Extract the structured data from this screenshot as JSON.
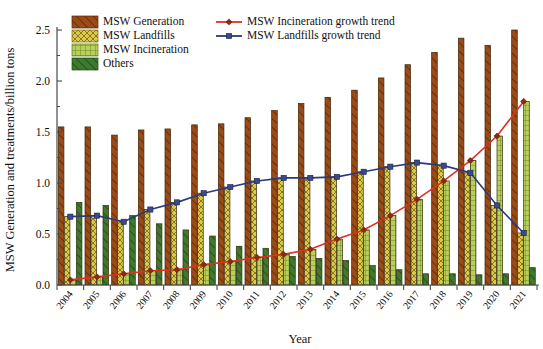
{
  "chart_data": {
    "type": "bar",
    "title": "",
    "xlabel": "Year",
    "ylabel": "MSW Generation and treatments/billion tons",
    "ylim": [
      0.0,
      2.5
    ],
    "ytick_labels": [
      "0.0",
      "0.5",
      "1.0",
      "1.5",
      "2.0",
      "2.5"
    ],
    "ytick_values": [
      0.0,
      0.5,
      1.0,
      1.5,
      2.0,
      2.5
    ],
    "grid": false,
    "legend_position": "top-left",
    "categories": [
      "2004",
      "2005",
      "2006",
      "2007",
      "2008",
      "2009",
      "2010",
      "2011",
      "2012",
      "2013",
      "2014",
      "2015",
      "2016",
      "2017",
      "2018",
      "2019",
      "2020",
      "2021"
    ],
    "series": [
      {
        "name": "MSW Generation",
        "kind": "bar",
        "color": "#9C4A16",
        "hatch": "diagonal",
        "values": [
          1.55,
          1.55,
          1.47,
          1.52,
          1.53,
          1.57,
          1.58,
          1.64,
          1.71,
          1.78,
          1.84,
          1.91,
          2.03,
          2.16,
          2.28,
          2.42,
          2.35,
          2.5
        ]
      },
      {
        "name": "MSW Landfills",
        "kind": "bar",
        "color": "#D9C44A",
        "hatch": "crosshatch",
        "values": [
          0.67,
          0.68,
          0.62,
          0.74,
          0.81,
          0.9,
          0.96,
          1.02,
          1.05,
          1.05,
          1.06,
          1.11,
          1.16,
          1.2,
          1.17,
          1.1,
          0.78,
          0.51
        ]
      },
      {
        "name": "MSW Incineration",
        "kind": "bar",
        "color": "#A9C84E",
        "hatch": "grid",
        "values": [
          0.05,
          0.08,
          0.11,
          0.14,
          0.15,
          0.2,
          0.23,
          0.27,
          0.3,
          0.35,
          0.45,
          0.54,
          0.68,
          0.84,
          1.02,
          1.22,
          1.46,
          1.8
        ]
      },
      {
        "name": "Others",
        "kind": "bar",
        "color": "#3E7A2E",
        "hatch": "diagonal",
        "values": [
          0.81,
          0.78,
          0.68,
          0.6,
          0.54,
          0.48,
          0.38,
          0.36,
          0.28,
          0.26,
          0.24,
          0.19,
          0.15,
          0.11,
          0.11,
          0.1,
          0.11,
          0.17
        ]
      },
      {
        "name": "MSW Incineration growth trend",
        "kind": "line",
        "color": "#E03020",
        "marker": "diamond",
        "marker_color": "#8B2A12",
        "values": [
          0.05,
          0.08,
          0.11,
          0.14,
          0.15,
          0.2,
          0.23,
          0.27,
          0.3,
          0.35,
          0.45,
          0.54,
          0.68,
          0.84,
          1.02,
          1.22,
          1.46,
          1.8
        ]
      },
      {
        "name": "MSW Landfills growth trend",
        "kind": "line",
        "color": "#2B3A7A",
        "marker": "square",
        "marker_color": "#3B4A8A",
        "values": [
          0.67,
          0.68,
          0.62,
          0.74,
          0.81,
          0.9,
          0.96,
          1.02,
          1.05,
          1.05,
          1.06,
          1.11,
          1.16,
          1.2,
          1.17,
          1.1,
          0.78,
          0.51
        ]
      }
    ],
    "legend_entries": [
      {
        "label": "MSW Generation",
        "type": "swatch",
        "color": "#9C4A16"
      },
      {
        "label": "MSW Landfills",
        "type": "swatch",
        "color": "#D9C44A"
      },
      {
        "label": "MSW Incineration",
        "type": "swatch",
        "color": "#A9C84E"
      },
      {
        "label": "Others",
        "type": "swatch",
        "color": "#3E7A2E"
      },
      {
        "label": "MSW Incineration growth trend",
        "type": "line",
        "color": "#E03020"
      },
      {
        "label": "MSW Landfills growth trend",
        "type": "line",
        "color": "#2B3A7A"
      }
    ]
  }
}
